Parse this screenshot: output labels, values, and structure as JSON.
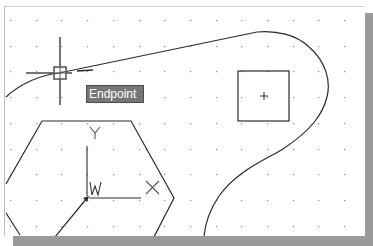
{
  "canvas": {
    "background": "#ffffff",
    "grid": {
      "visible": true,
      "spacing_px": 25.7,
      "dot_color": "#8a8a8a"
    },
    "line_color": "#2a2a2a"
  },
  "osnap_tooltip": {
    "label": "Endpoint",
    "background": "#767676",
    "text_color": "#ffffff"
  },
  "ucs_icon": {
    "x_label": "X",
    "y_label": "Y",
    "w_label": "W"
  },
  "cursor": {
    "type": "crosshair-with-pickbox",
    "marker": "endpoint-square"
  },
  "entities": [
    {
      "type": "spline",
      "name": "curved-outline"
    },
    {
      "type": "rectangle",
      "name": "square-with-center-mark"
    },
    {
      "type": "polygon",
      "name": "hexagon"
    },
    {
      "type": "line",
      "name": "diagonal-line"
    }
  ]
}
